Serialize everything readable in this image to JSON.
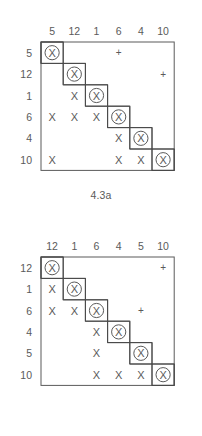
{
  "document": {
    "type": "figure-pair",
    "background_color": "#ffffff",
    "ink_color": "#5a5a5a"
  },
  "figures": [
    {
      "id": "4.3a",
      "caption": "4.3a",
      "column_headers": [
        "5",
        "12",
        "1",
        "6",
        "4",
        "10"
      ],
      "row_headers": [
        "5",
        "12",
        "1",
        "6",
        "4",
        "10"
      ],
      "cells": [
        [
          "circled-x",
          "",
          "",
          "plus",
          "",
          ""
        ],
        [
          "",
          "circled-x",
          "",
          "",
          "",
          "plus"
        ],
        [
          "",
          "x",
          "circled-x",
          "",
          "",
          ""
        ],
        [
          "x",
          "x",
          "x",
          "circled-x",
          "",
          ""
        ],
        [
          "",
          "",
          "",
          "x",
          "circled-x",
          ""
        ],
        [
          "x",
          "",
          "",
          "x",
          "x",
          "circled-x"
        ]
      ]
    },
    {
      "id": "4.3b",
      "caption": "4.3b",
      "column_headers": [
        "12",
        "1",
        "6",
        "4",
        "5",
        "10"
      ],
      "row_headers": [
        "12",
        "1",
        "6",
        "4",
        "5",
        "10"
      ],
      "cells": [
        [
          "circled-x",
          "",
          "",
          "",
          "",
          "plus"
        ],
        [
          "x",
          "circled-x",
          "",
          "",
          "",
          ""
        ],
        [
          "x",
          "x",
          "circled-x",
          "",
          "plus",
          ""
        ],
        [
          "",
          "",
          "x",
          "circled-x",
          "",
          ""
        ],
        [
          "",
          "",
          "x",
          "",
          "circled-x",
          ""
        ],
        [
          "",
          "",
          "x",
          "x",
          "x",
          "circled-x"
        ]
      ]
    }
  ],
  "glyphs": {
    "x": "X",
    "plus": "+",
    "circled_x": "circled-x"
  }
}
